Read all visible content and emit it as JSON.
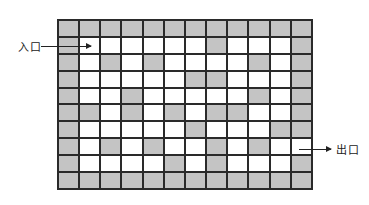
{
  "diagram": {
    "type": "maze",
    "rows": 10,
    "cols": 12,
    "colors": {
      "wall": "#c4c4c4",
      "path": "#ffffff",
      "grid_line": "#2a2a2a"
    },
    "grid": [
      [
        1,
        1,
        1,
        1,
        1,
        1,
        1,
        1,
        1,
        1,
        1,
        1
      ],
      [
        1,
        0,
        0,
        0,
        0,
        0,
        0,
        1,
        0,
        0,
        0,
        1
      ],
      [
        1,
        0,
        1,
        0,
        1,
        0,
        0,
        0,
        0,
        1,
        0,
        1
      ],
      [
        1,
        0,
        0,
        0,
        0,
        0,
        1,
        1,
        0,
        0,
        0,
        1
      ],
      [
        1,
        0,
        0,
        1,
        0,
        0,
        0,
        0,
        0,
        1,
        0,
        1
      ],
      [
        1,
        1,
        0,
        1,
        0,
        1,
        0,
        1,
        1,
        0,
        0,
        1
      ],
      [
        1,
        0,
        0,
        0,
        0,
        0,
        1,
        0,
        0,
        0,
        1,
        1
      ],
      [
        1,
        0,
        1,
        0,
        1,
        0,
        0,
        1,
        0,
        1,
        0,
        0
      ],
      [
        1,
        0,
        0,
        0,
        0,
        1,
        0,
        1,
        0,
        0,
        0,
        1
      ],
      [
        1,
        1,
        1,
        1,
        1,
        1,
        1,
        1,
        1,
        1,
        1,
        1
      ]
    ],
    "entrance": {
      "label": "入口",
      "row": 1,
      "col": 1
    },
    "exit": {
      "label": "出口",
      "row": 7,
      "col": 11
    }
  }
}
